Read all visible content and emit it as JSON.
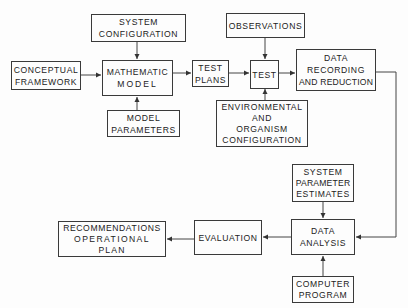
{
  "diagram": {
    "type": "flowchart",
    "nodes": {
      "system_configuration": {
        "lines": [
          "SYSTEM",
          "CONFIGURATION"
        ]
      },
      "conceptual_framework": {
        "lines": [
          "CONCEPTUAL",
          "FRAMEWORK"
        ]
      },
      "mathematic_model": {
        "lines": [
          "MATHEMATIC",
          "MODEL"
        ]
      },
      "model_parameters": {
        "lines": [
          "MODEL",
          "PARAMETERS"
        ]
      },
      "test_plans": {
        "lines": [
          "TEST",
          "PLANS"
        ]
      },
      "observations": {
        "lines": [
          "OBSERVATIONS"
        ]
      },
      "test": {
        "lines": [
          "TEST"
        ]
      },
      "environmental_config": {
        "lines": [
          "ENVIRONMENTAL",
          "AND",
          "ORGANISM",
          "CONFIGURATION"
        ]
      },
      "data_recording": {
        "lines": [
          "DATA",
          "RECORDING",
          "AND REDUCTION"
        ]
      },
      "system_parameter_estimates": {
        "lines": [
          "SYSTEM",
          "PARAMETER",
          "ESTIMATES"
        ]
      },
      "data_analysis": {
        "lines": [
          "DATA",
          "ANALYSIS"
        ]
      },
      "computer_program": {
        "lines": [
          "COMPUTER",
          "PROGRAM"
        ]
      },
      "evaluation": {
        "lines": [
          "EVALUATION"
        ]
      },
      "recommendations": {
        "lines": [
          "RECOMMENDATIONS",
          "OPERATIONAL",
          "PLAN"
        ]
      }
    },
    "edges": [
      {
        "from": "system_configuration",
        "to": "mathematic_model"
      },
      {
        "from": "conceptual_framework",
        "to": "mathematic_model"
      },
      {
        "from": "model_parameters",
        "to": "mathematic_model"
      },
      {
        "from": "mathematic_model",
        "to": "test_plans"
      },
      {
        "from": "test_plans",
        "to": "test"
      },
      {
        "from": "observations",
        "to": "test"
      },
      {
        "from": "environmental_config",
        "to": "test"
      },
      {
        "from": "test",
        "to": "data_recording"
      },
      {
        "from": "data_recording",
        "to": "data_analysis"
      },
      {
        "from": "system_parameter_estimates",
        "to": "data_analysis"
      },
      {
        "from": "computer_program",
        "to": "data_analysis"
      },
      {
        "from": "data_analysis",
        "to": "evaluation"
      },
      {
        "from": "evaluation",
        "to": "recommendations"
      }
    ]
  }
}
